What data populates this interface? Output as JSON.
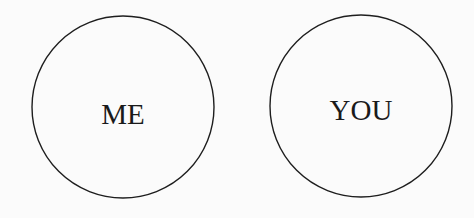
{
  "diagram": {
    "type": "two-circles",
    "stroke_color": "#1e1e1e",
    "background_color": "#fbfbfb",
    "circles": [
      {
        "label": "ME",
        "cx": 123,
        "cy": 107,
        "r": 91
      },
      {
        "label": "YOU",
        "cx": 361,
        "cy": 106,
        "r": 91
      }
    ]
  }
}
